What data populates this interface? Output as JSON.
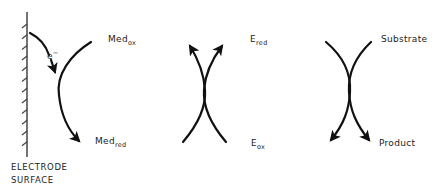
{
  "diagram": {
    "electrode": {
      "caption_line1": "ELECTRODE",
      "caption_line2": "SURFACE",
      "electron_label": "e",
      "electron_charge": "−"
    },
    "mediator": {
      "ox_base": "Med",
      "ox_sub": "ox",
      "red_base": "Med",
      "red_sub": "red"
    },
    "enzyme": {
      "red_base": "E",
      "red_sub": "red",
      "ox_base": "E",
      "ox_sub": "ox"
    },
    "substrate": {
      "input_label": "Substrate",
      "output_label": "Product"
    },
    "colors": {
      "ink": "#111111",
      "background": "#ffffff"
    }
  }
}
